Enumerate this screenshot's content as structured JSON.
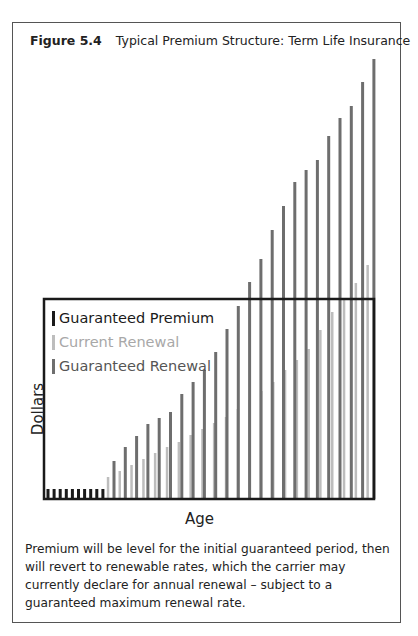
{
  "figure": {
    "number": "Figure 5.4",
    "title": "Typical Premium Structure: Term Life Insurance",
    "caption": "Premium will be level for the initial guaranteed period, then will revert to renewable rates, which the carrier may currently declare for annual renewal – subject to a guaranteed maximum renewal rate."
  },
  "colors": {
    "guaranteed_premium": "#1a1a1a",
    "current_renewal": "#bdbdbd",
    "guaranteed_renewal": "#6e6e6e",
    "axis": "#1a1a1a",
    "frame": "#555555"
  },
  "chart_data": {
    "type": "bar",
    "title": "Typical Premium Structure: Term Life Insurance",
    "xlabel": "Age",
    "ylabel": "Dollars",
    "grid": false,
    "legend_position": "upper-left inside plot",
    "units_note": "No numeric ticks shown; values are relative bar heights in pixels above baseline",
    "series": [
      {
        "name": "Guaranteed Premium",
        "color": "#1a1a1a",
        "x_start": 48,
        "x_step": 6.1,
        "values": [
          10,
          10,
          10,
          10,
          10,
          10,
          10,
          10,
          10,
          10
        ]
      },
      {
        "name": "Current Renewal",
        "color": "#bdbdbd",
        "x_start": 108,
        "x_step": 11.8,
        "values": [
          22,
          28,
          34,
          40,
          46,
          52,
          57,
          64,
          70,
          76,
          82,
          90,
          99,
          108,
          117,
          129,
          139,
          150,
          169,
          187,
          199,
          216,
          234
        ]
      },
      {
        "name": "Guaranteed Renewal",
        "color": "#6e6e6e",
        "x_start": 114,
        "x_step": 11.3,
        "values": [
          38,
          52,
          63,
          75,
          81,
          87,
          105,
          117,
          129,
          147,
          170,
          193,
          217,
          240,
          269,
          293,
          317,
          329,
          339,
          363,
          381,
          393,
          417,
          440
        ]
      }
    ],
    "plot_box": {
      "left": 44,
      "top": 299,
      "right": 374,
      "baseline": 499
    }
  },
  "legend": {
    "items": [
      {
        "label": "Guaranteed Premium",
        "color": "#1a1a1a",
        "text_color": "#1a1a1a"
      },
      {
        "label": "Current Renewal",
        "color": "#bdbdbd",
        "text_color": "#a8a8a8"
      },
      {
        "label": "Guaranteed Renewal",
        "color": "#6e6e6e",
        "text_color": "#555555"
      }
    ]
  }
}
